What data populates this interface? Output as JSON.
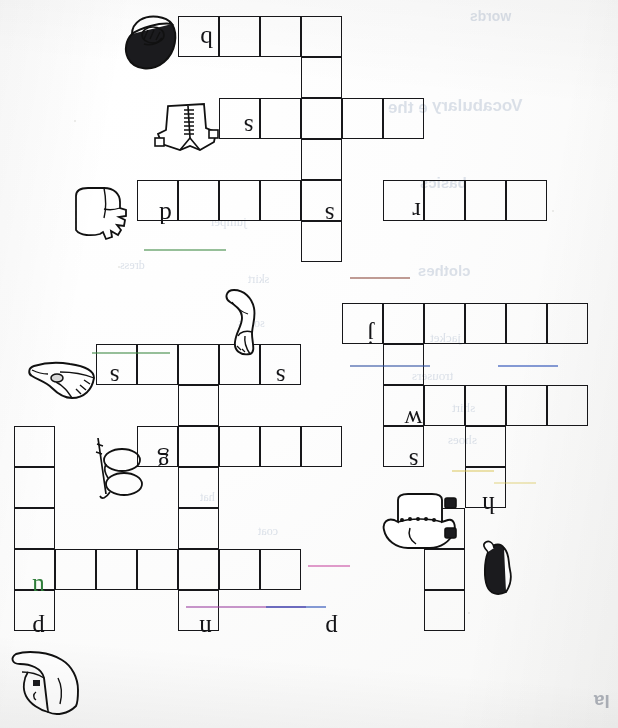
{
  "worksheet": {
    "title": "Clothes Crossword Puzzle Worksheet",
    "orientation": "rotated-180",
    "page_corner_text": "la"
  },
  "grid": {
    "cell_size": 41,
    "origin_x": 14,
    "origin_y": 16,
    "entries": [
      {
        "id": "entry-1",
        "direction": "across",
        "letter": "b",
        "cells": 4,
        "col": 4,
        "row": 0,
        "clue_image": "cap"
      },
      {
        "id": "entry-2",
        "direction": "across",
        "letter": "s",
        "cells": 5,
        "col": 5,
        "row": 2,
        "clue_image": "shirt"
      },
      {
        "id": "entry-3",
        "direction": "across",
        "letter": "d",
        "cells": 5,
        "col": 3,
        "row": 4,
        "clue_image": "glove"
      },
      {
        "id": "entry-4",
        "direction": "across",
        "letter": "r",
        "cells": 4,
        "col": 9,
        "row": 4,
        "clue_image": "none"
      },
      {
        "id": "entry-5",
        "direction": "across",
        "letter": "s",
        "cells": 5,
        "col": 2,
        "row": 8,
        "clue_image": "bird-shoe"
      },
      {
        "id": "entry-6",
        "direction": "across",
        "letter": "j",
        "cells": 6,
        "col": 8,
        "row": 7,
        "clue_image": "none"
      },
      {
        "id": "entry-7",
        "direction": "across",
        "letter": "w",
        "cells": 5,
        "col": 9,
        "row": 9,
        "clue_image": "none"
      },
      {
        "id": "entry-8",
        "direction": "across",
        "letter": "g",
        "cells": 5,
        "col": 3,
        "row": 10,
        "clue_image": "glasses"
      },
      {
        "id": "entry-9",
        "direction": "across",
        "letter": "u",
        "cells": 7,
        "col": 0,
        "row": 13,
        "clue_image": "none"
      },
      {
        "id": "entry-10",
        "direction": "down",
        "letter": "s",
        "cells": 6,
        "col": 7,
        "row": 0,
        "clue_image": "sock"
      },
      {
        "id": "entry-11",
        "direction": "down",
        "letter": "h",
        "cells": 2,
        "col": 11,
        "row": 10,
        "clue_image": "hat"
      },
      {
        "id": "entry-12",
        "direction": "down",
        "letter": "p",
        "cells": 5,
        "col": 0,
        "row": 10,
        "clue_image": "shoe"
      },
      {
        "id": "entry-13",
        "direction": "down",
        "letter": "n",
        "cells": 6,
        "col": 4,
        "row": 9,
        "clue_image": "none"
      },
      {
        "id": "entry-14",
        "direction": "down",
        "letter": "s",
        "cells": 4,
        "col": 9,
        "row": 7,
        "clue_image": "sweater"
      },
      {
        "id": "entry-15",
        "direction": "down",
        "letter": "p",
        "cells": 3,
        "col": 10,
        "row": 12,
        "clue_image": "none"
      }
    ],
    "letters": [
      {
        "name": "letter-b",
        "value": "b",
        "x": 186,
        "y": 18
      },
      {
        "name": "letter-s-shirt",
        "value": "s",
        "x": 228,
        "y": 106
      },
      {
        "name": "letter-d-glove",
        "value": "d",
        "x": 145,
        "y": 194
      },
      {
        "name": "letter-s-down",
        "value": "s",
        "x": 309,
        "y": 194
      },
      {
        "name": "letter-r",
        "value": "r",
        "x": 396,
        "y": 190
      },
      {
        "name": "letter-j",
        "value": "j",
        "x": 350,
        "y": 314
      },
      {
        "name": "letter-s-bird",
        "value": "s",
        "x": 94,
        "y": 356
      },
      {
        "name": "letter-s-cross",
        "value": "s",
        "x": 260,
        "y": 356
      },
      {
        "name": "letter-w",
        "value": "w",
        "x": 393,
        "y": 398
      },
      {
        "name": "letter-s-sweater",
        "value": "s",
        "x": 393,
        "y": 440
      },
      {
        "name": "letter-g",
        "value": "g",
        "x": 143,
        "y": 440
      },
      {
        "name": "letter-h",
        "value": "h",
        "x": 468,
        "y": 484
      },
      {
        "name": "letter-u",
        "value": "u",
        "x": 18,
        "y": 566
      },
      {
        "name": "letter-p-left",
        "value": "p",
        "x": 18,
        "y": 607
      },
      {
        "name": "letter-n",
        "value": "n",
        "x": 185,
        "y": 607
      },
      {
        "name": "letter-p-right",
        "value": "p",
        "x": 311,
        "y": 607
      }
    ]
  },
  "clipart": [
    {
      "name": "cap-image",
      "label": "cap",
      "x": 120,
      "y": 8
    },
    {
      "name": "shirt-image",
      "label": "shirt",
      "x": 152,
      "y": 96
    },
    {
      "name": "glove-image",
      "label": "glove",
      "x": 70,
      "y": 184
    },
    {
      "name": "sock-image",
      "label": "sock",
      "x": 222,
      "y": 288
    },
    {
      "name": "bird-shoe-image",
      "label": "shoe",
      "x": 28,
      "y": 352
    },
    {
      "name": "glasses-image",
      "label": "glasses",
      "x": 92,
      "y": 430
    },
    {
      "name": "sweater-image",
      "label": "sweater",
      "x": 380,
      "y": 492
    },
    {
      "name": "hat-image",
      "label": "hat",
      "x": 472,
      "y": 540
    },
    {
      "name": "boot-image",
      "label": "boot",
      "x": 6,
      "y": 650
    }
  ],
  "bleed_through": [
    {
      "text": "Vocabulary",
      "x": 432,
      "y": 96,
      "size": 17,
      "weight": "700"
    },
    {
      "text": "e the",
      "x": 388,
      "y": 98,
      "size": 17,
      "weight": "700"
    },
    {
      "text": "words",
      "x": 470,
      "y": 8,
      "size": 14,
      "weight": "700"
    },
    {
      "text": "basics",
      "x": 420,
      "y": 174,
      "size": 15,
      "weight": "700"
    },
    {
      "text": "clothes",
      "x": 418,
      "y": 262,
      "size": 15,
      "weight": "700"
    },
    {
      "text": "jacket",
      "x": 430,
      "y": 330,
      "size": 13,
      "weight": "400"
    },
    {
      "text": "trousers",
      "x": 412,
      "y": 368,
      "size": 13,
      "weight": "400"
    },
    {
      "text": "shirt",
      "x": 452,
      "y": 400,
      "size": 13,
      "weight": "400"
    },
    {
      "text": "shoes",
      "x": 448,
      "y": 432,
      "size": 13,
      "weight": "400"
    },
    {
      "text": "jumper",
      "x": 210,
      "y": 214,
      "size": 13,
      "weight": "400"
    },
    {
      "text": "skirt",
      "x": 248,
      "y": 272,
      "size": 12,
      "weight": "400"
    },
    {
      "text": "socks",
      "x": 238,
      "y": 316,
      "size": 12,
      "weight": "400"
    },
    {
      "text": "dress",
      "x": 120,
      "y": 258,
      "size": 12,
      "weight": "400"
    },
    {
      "text": "hat",
      "x": 200,
      "y": 490,
      "size": 12,
      "weight": "400"
    },
    {
      "text": "coat",
      "x": 258,
      "y": 524,
      "size": 12,
      "weight": "400"
    }
  ],
  "colors": {
    "ink": "#17171a",
    "paper": "#fdfdfc",
    "bleed": "#b9c4d4",
    "green_ink": "#2f7d3a"
  }
}
